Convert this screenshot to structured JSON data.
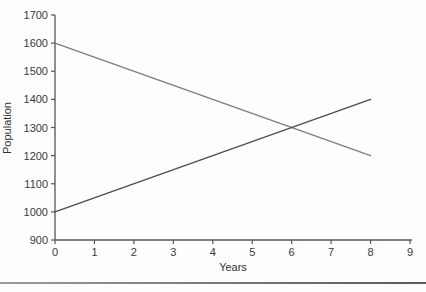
{
  "page": {
    "background": "#fdfdfd",
    "divider_color_left": "#9a9a9a",
    "divider_color_right": "#5a5a5a"
  },
  "chart_data": {
    "type": "line",
    "title": "",
    "xlabel": "Years",
    "ylabel": "Population",
    "xlim": [
      0,
      9
    ],
    "ylim": [
      900,
      1700
    ],
    "x_ticks": [
      0,
      1,
      2,
      3,
      4,
      5,
      6,
      7,
      8,
      9
    ],
    "y_ticks": [
      900,
      1000,
      1100,
      1200,
      1300,
      1400,
      1500,
      1600,
      1700
    ],
    "grid": false,
    "legend": "none",
    "axis_color": "#555555",
    "tick_label_color": "#3a3a3a",
    "intersection": {
      "x": 6,
      "y": 1300
    },
    "series": [
      {
        "name": "declining-line",
        "x": [
          0,
          8
        ],
        "y": [
          1600,
          1200
        ],
        "color": "#7d7d7d",
        "width": 1.4
      },
      {
        "name": "rising-line",
        "x": [
          0,
          8
        ],
        "y": [
          1000,
          1400
        ],
        "color": "#4f4f4f",
        "width": 1.5
      }
    ]
  }
}
